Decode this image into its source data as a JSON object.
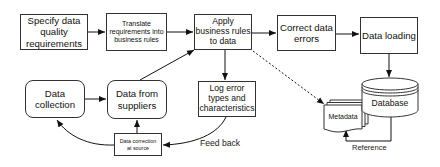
{
  "diagram": {
    "type": "flowchart",
    "nodes": {
      "specify": {
        "label": "Specify data quality requirements",
        "shape": "rectangle"
      },
      "translate": {
        "label": "Translate requirements into business rules",
        "shape": "rectangle"
      },
      "apply": {
        "label": "Apply business rules to data",
        "shape": "rectangle"
      },
      "correct": {
        "label": "Correct data errors",
        "shape": "rectangle"
      },
      "loading": {
        "label": "Data loading",
        "shape": "rectangle"
      },
      "collection": {
        "label": "Data collection",
        "shape": "rounded-rectangle"
      },
      "suppliers": {
        "label": "Data from suppliers",
        "shape": "rounded-rectangle"
      },
      "log": {
        "label": "Log error types and characteristics",
        "shape": "rectangle"
      },
      "correction_source": {
        "label": "Data correction at source",
        "shape": "rectangle"
      },
      "metadata": {
        "label": "Metadata",
        "shape": "multi-document"
      },
      "database": {
        "label": "Database",
        "shape": "cylinder"
      }
    },
    "edge_labels": {
      "feedback": "Feed back",
      "reference": "Reference"
    },
    "edges": [
      {
        "from": "specify",
        "to": "translate",
        "style": "solid"
      },
      {
        "from": "translate",
        "to": "apply",
        "style": "solid"
      },
      {
        "from": "apply",
        "to": "correct",
        "style": "solid"
      },
      {
        "from": "correct",
        "to": "loading",
        "style": "solid"
      },
      {
        "from": "loading",
        "to": "database",
        "style": "solid"
      },
      {
        "from": "apply",
        "to": "log",
        "style": "solid"
      },
      {
        "from": "apply",
        "to": "metadata",
        "style": "dashed"
      },
      {
        "from": "suppliers",
        "to": "apply",
        "style": "solid"
      },
      {
        "from": "collection",
        "to": "suppliers",
        "style": "solid"
      },
      {
        "from": "log",
        "to": "correction_source",
        "style": "solid",
        "label": "Feed back"
      },
      {
        "from": "correction_source",
        "to": "suppliers",
        "style": "solid"
      },
      {
        "from": "correction_source",
        "to": "collection",
        "style": "solid"
      },
      {
        "from": "database",
        "to": "metadata",
        "style": "solid",
        "label": "Reference"
      }
    ]
  }
}
